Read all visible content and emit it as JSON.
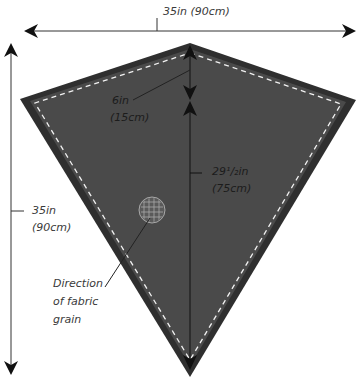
{
  "diagram": {
    "colors": {
      "fabric": "#4a4a4a",
      "fabric_edge": "#2f2f2f",
      "seam": "#f2f2f2",
      "arrow": "#111111",
      "text": "#3a3a3a"
    },
    "width_dimension": {
      "label": "35in (90cm)"
    },
    "height_dimension": {
      "line1": "35in",
      "line2": "(90cm)"
    },
    "top_section": {
      "line1": "6in",
      "line2": "(15cm)"
    },
    "lower_section": {
      "line1": "29¹/₂in",
      "line2": "(75cm)"
    },
    "grain_note": {
      "line1": "Direction",
      "line2": "of fabric",
      "line3": "grain"
    },
    "icons": [
      "grain-grid-circle-icon",
      "arrowhead-icon"
    ]
  }
}
